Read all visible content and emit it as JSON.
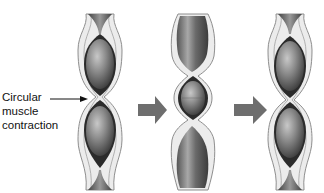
{
  "figure": {
    "label": {
      "lines": [
        "Circular",
        "muscle",
        "contraction"
      ]
    },
    "panels": [
      {
        "id": "stage-1",
        "center_x": 100,
        "state": "contraction between two food boluses"
      },
      {
        "id": "stage-2",
        "center_x": 193,
        "state": "relaxed segments, bolus moved"
      },
      {
        "id": "stage-3",
        "center_x": 290,
        "state": "contraction repeats"
      }
    ],
    "arrows": [
      {
        "from": "stage-1",
        "to": "stage-2"
      },
      {
        "from": "stage-2",
        "to": "stage-3"
      }
    ],
    "colors": {
      "arrow": "#6e6e6e",
      "tube_wall": "#e8e8e8",
      "tube_outline": "#9a9a9a",
      "lumen": "#2a2a2a",
      "bolus": "#7a7a7a"
    }
  }
}
